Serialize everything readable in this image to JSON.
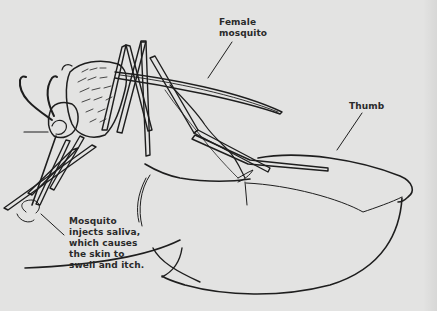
{
  "figure": {
    "background_color": "#e3e3e2",
    "line_color": "#1e1e1e",
    "text_color": "#2a2a2a"
  },
  "labels": {
    "female_mosquito": "Female\nmosquito",
    "thumb": "Thumb",
    "saliva_note": "Mosquito\ninjects saliva,\nwhich causes\nthe skin to\nswell and itch."
  }
}
